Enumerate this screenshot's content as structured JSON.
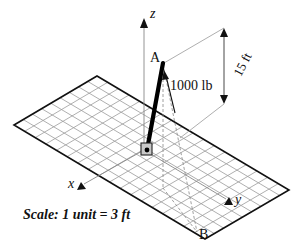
{
  "figure": {
    "axes": {
      "x_label": "x",
      "y_label": "y",
      "z_label": "z"
    },
    "points": {
      "A": "A",
      "B": "B"
    },
    "force_label": "1000 lb",
    "dimension_label": "15 ft",
    "scale_label": "Scale: 1 unit = 3 ft",
    "grid": {
      "short_divisions": 9,
      "long_divisions": 18
    },
    "colors": {
      "line": "#111111",
      "grid": "#9a9a9a",
      "pole": "#000000",
      "anchor_fill": "#c8c8c8"
    }
  }
}
